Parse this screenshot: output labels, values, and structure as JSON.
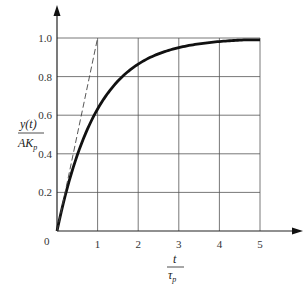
{
  "chart_data": {
    "type": "line",
    "title": "",
    "xlabel": "t / τp",
    "ylabel": "y(t) / AKp",
    "xlim": [
      0,
      5
    ],
    "ylim": [
      0,
      1.0
    ],
    "grid": true,
    "x_ticks": [
      "0",
      "1",
      "2",
      "3",
      "4",
      "5"
    ],
    "y_ticks": [
      "0.2",
      "0.4",
      "0.6",
      "0.8",
      "1.0"
    ],
    "origin_label": "0",
    "series": [
      {
        "name": "step response (1 - e^(-t/τp))",
        "style": "solid-thick",
        "x": [
          0,
          0.5,
          1,
          1.5,
          2,
          2.5,
          3,
          3.5,
          4,
          4.5,
          5
        ],
        "y": [
          0,
          0.39,
          0.63,
          0.78,
          0.86,
          0.92,
          0.95,
          0.97,
          0.98,
          0.99,
          0.99
        ]
      },
      {
        "name": "initial slope tangent",
        "style": "dashed",
        "x": [
          0,
          1
        ],
        "y": [
          0,
          1.0
        ]
      }
    ]
  },
  "labels": {
    "y_num": "y(t)",
    "y_den_A": "AK",
    "y_den_sub": "p",
    "x_num": "t",
    "x_den": "τ",
    "x_den_sub": "p"
  }
}
